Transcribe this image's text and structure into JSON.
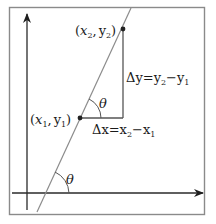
{
  "diagram": {
    "type": "slope-angle-diagram",
    "colors": {
      "frame": "#8a8a8a",
      "axes": "#2a2a2a",
      "line": "#8c8c8c",
      "triangle": "#555555",
      "point": "#222222",
      "text": "#1a1a1a"
    },
    "points": {
      "p1": {
        "label_x": "x",
        "label_x_sub": "1",
        "label_y": "y",
        "label_y_sub": "1",
        "open": "(",
        "comma": ",",
        "close": ")"
      },
      "p2": {
        "label_x": "x",
        "label_x_sub": "2",
        "label_y": "y",
        "label_y_sub": "2",
        "open": "(",
        "comma": ",",
        "close": ")"
      }
    },
    "delta_y": {
      "prefix": "Δy=y",
      "sub_a": "2",
      "minus": "−y",
      "sub_b": "1"
    },
    "delta_x": {
      "prefix": "Δx=x",
      "sub_a": "2",
      "minus": "−x",
      "sub_b": "1"
    },
    "angles": {
      "upper": "θ",
      "lower": "θ"
    }
  }
}
